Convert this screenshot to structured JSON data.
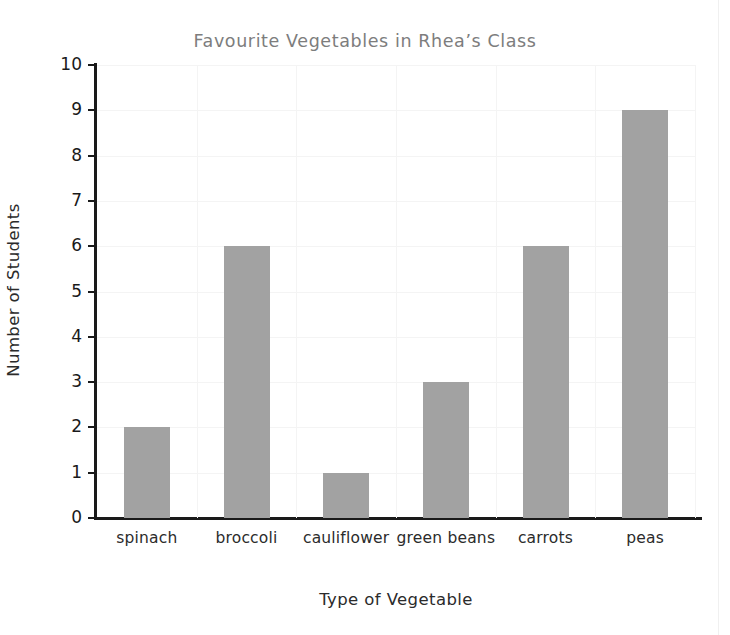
{
  "chart_data": {
    "type": "bar",
    "title": "Favourite Vegetables in Rhea’s Class",
    "xlabel": "Type of Vegetable",
    "ylabel": "Number of Students",
    "categories": [
      "spinach",
      "broccoli",
      "cauliflower",
      "green beans",
      "carrots",
      "peas"
    ],
    "values": [
      2,
      6,
      1,
      3,
      6,
      9
    ],
    "ylim": [
      0,
      10
    ],
    "ytick_labels": [
      "0",
      "1",
      "2",
      "3",
      "4",
      "5",
      "6",
      "7",
      "8",
      "9",
      "10"
    ],
    "ytick_values": [
      0,
      1,
      2,
      3,
      4,
      5,
      6,
      7,
      8,
      9,
      10
    ],
    "grid": "both",
    "legend": "none",
    "bar_color": "#a2a2a2",
    "axis_color": "#1a1a1a",
    "grid_color": "#f4f4f4",
    "title_color": "#7d7d7d",
    "background": "#ffffff"
  }
}
